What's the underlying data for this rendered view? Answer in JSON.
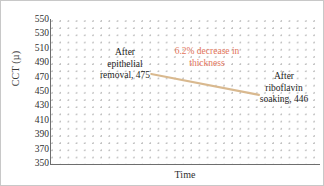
{
  "chart_data": {
    "type": "line",
    "title": "",
    "xlabel": "Time",
    "ylabel": "CCT (µ)",
    "ylim": [
      350,
      550
    ],
    "yticks": [
      550,
      530,
      510,
      490,
      470,
      450,
      430,
      410,
      390,
      370,
      350
    ],
    "xticks": [],
    "grid": "dotted",
    "legend": "none",
    "x": [
      "After epithelial removal",
      "After riboflavin soaking"
    ],
    "values": [
      475,
      446
    ],
    "series": [
      {
        "name": "CCT",
        "values": [
          475,
          446
        ],
        "color": "#d9b98f"
      }
    ],
    "annotations": [
      {
        "id": "left",
        "text": "After\nepithelial\nremoval, 475",
        "value": 475,
        "color": "#1d1d1d"
      },
      {
        "id": "callout",
        "text": "6.2% decrease in\nthickness",
        "value": 6.2,
        "color": "#e2745a"
      },
      {
        "id": "right",
        "text": "After\nriboflavin\nsoaking, 446",
        "value": 446,
        "color": "#1d1d1d"
      }
    ]
  },
  "axes": {
    "y_title": "CCT (µ)",
    "x_title": "Time",
    "tick_labels": [
      "550",
      "530",
      "510",
      "490",
      "470",
      "450",
      "430",
      "410",
      "390",
      "370",
      "350"
    ]
  },
  "annotations": {
    "left_label": "After\nepithelial\nremoval, 475",
    "callout_label": "6.2% decrease in\nthickness",
    "right_label": "After\nriboflavin\nsoaking, 446"
  },
  "colors": {
    "line": "#d9b98f",
    "callout": "#e2745a",
    "grid_dot": "#c0c0c0",
    "axis": "#6e6e6e",
    "text": "#1d1d1d",
    "background": "#ffffff"
  }
}
